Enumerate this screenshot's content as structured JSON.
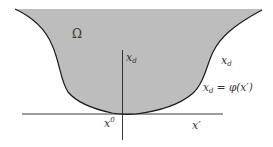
{
  "diagram": {
    "region": {
      "label": "Ω",
      "fill": "#bdbdbd",
      "stroke": "#1a1a1a"
    },
    "axes": {
      "vertical_label_main": "x",
      "vertical_label_sub": "d",
      "horizontal_label": "x′",
      "origin_label_main": "x",
      "origin_label_sup": "0",
      "color": "#222222"
    },
    "annotations": {
      "side_label_main": "x",
      "side_label_sub": "d",
      "graph_eq_lhs_main": "x",
      "graph_eq_lhs_sub": "d",
      "graph_eq_rhs": " = φ(x′)"
    }
  }
}
